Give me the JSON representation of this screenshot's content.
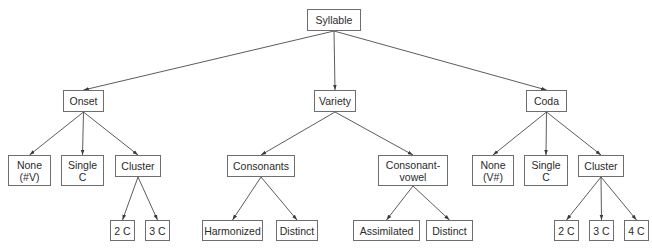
{
  "diagram": {
    "type": "tree",
    "root": "syllable",
    "nodes": [
      {
        "id": "syllable",
        "label": "Syllable",
        "x": 307,
        "y": 9,
        "w": 54,
        "h": 22
      },
      {
        "id": "onset",
        "label": "Onset",
        "x": 63,
        "y": 90,
        "w": 41,
        "h": 22
      },
      {
        "id": "variety",
        "label": "Variety",
        "x": 314,
        "y": 90,
        "w": 42,
        "h": 22
      },
      {
        "id": "coda",
        "label": "Coda",
        "x": 526,
        "y": 90,
        "w": 41,
        "h": 22
      },
      {
        "id": "onset-none",
        "label": "None\n(#V)",
        "x": 8,
        "y": 155,
        "w": 43,
        "h": 31
      },
      {
        "id": "onset-single",
        "label": "Single\nC",
        "x": 61,
        "y": 155,
        "w": 43,
        "h": 31
      },
      {
        "id": "onset-cluster",
        "label": "Cluster",
        "x": 115,
        "y": 155,
        "w": 46,
        "h": 22
      },
      {
        "id": "onset-2c",
        "label": "2 C",
        "x": 110,
        "y": 220,
        "w": 25,
        "h": 21
      },
      {
        "id": "onset-3c",
        "label": "3 C",
        "x": 145,
        "y": 220,
        "w": 25,
        "h": 21
      },
      {
        "id": "consonants",
        "label": "Consonants",
        "x": 227,
        "y": 155,
        "w": 68,
        "h": 22
      },
      {
        "id": "consonant-vowel",
        "label": "Consonant-\nvowel",
        "x": 378,
        "y": 155,
        "w": 70,
        "h": 31
      },
      {
        "id": "harmonized",
        "label": "Harmonized",
        "x": 202,
        "y": 220,
        "w": 61,
        "h": 21
      },
      {
        "id": "consonants-distinct",
        "label": "Distinct",
        "x": 276,
        "y": 220,
        "w": 42,
        "h": 21
      },
      {
        "id": "assimilated",
        "label": "Assimilated",
        "x": 353,
        "y": 220,
        "w": 67,
        "h": 21
      },
      {
        "id": "cv-distinct",
        "label": "Distinct",
        "x": 426,
        "y": 220,
        "w": 47,
        "h": 21
      },
      {
        "id": "coda-none",
        "label": "None\n(V#)",
        "x": 472,
        "y": 155,
        "w": 42,
        "h": 31
      },
      {
        "id": "coda-single",
        "label": "Single\nC",
        "x": 524,
        "y": 155,
        "w": 44,
        "h": 31
      },
      {
        "id": "coda-cluster",
        "label": "Cluster",
        "x": 578,
        "y": 155,
        "w": 46,
        "h": 22
      },
      {
        "id": "coda-2c",
        "label": "2 C",
        "x": 554,
        "y": 220,
        "w": 25,
        "h": 21
      },
      {
        "id": "coda-3c",
        "label": "3 C",
        "x": 589,
        "y": 220,
        "w": 25,
        "h": 21
      },
      {
        "id": "coda-4c",
        "label": "4 C",
        "x": 624,
        "y": 220,
        "w": 25,
        "h": 21
      }
    ],
    "edges": [
      [
        "syllable",
        "onset"
      ],
      [
        "syllable",
        "variety"
      ],
      [
        "syllable",
        "coda"
      ],
      [
        "onset",
        "onset-none"
      ],
      [
        "onset",
        "onset-single"
      ],
      [
        "onset",
        "onset-cluster"
      ],
      [
        "onset-cluster",
        "onset-2c"
      ],
      [
        "onset-cluster",
        "onset-3c"
      ],
      [
        "variety",
        "consonants"
      ],
      [
        "variety",
        "consonant-vowel"
      ],
      [
        "consonants",
        "harmonized"
      ],
      [
        "consonants",
        "consonants-distinct"
      ],
      [
        "consonant-vowel",
        "assimilated"
      ],
      [
        "consonant-vowel",
        "cv-distinct"
      ],
      [
        "coda",
        "coda-none"
      ],
      [
        "coda",
        "coda-single"
      ],
      [
        "coda",
        "coda-cluster"
      ],
      [
        "coda-cluster",
        "coda-2c"
      ],
      [
        "coda-cluster",
        "coda-3c"
      ],
      [
        "coda-cluster",
        "coda-4c"
      ]
    ],
    "colors": {
      "line": "#4a4a4a",
      "border": "#6e6e6e",
      "text": "#2a2a2a",
      "background": "#ffffff"
    }
  }
}
